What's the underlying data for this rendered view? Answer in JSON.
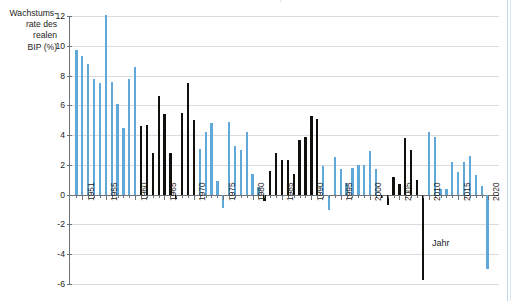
{
  "title_faint": "Wachstumsrate des realen Bruttoinlandsprodukts in Deutschland 1950–2020",
  "y_axis": {
    "label_lines": [
      "Wachstums-",
      "rate des",
      "realen",
      "BIP (%)"
    ],
    "ticks": [
      12,
      10,
      8,
      6,
      4,
      2,
      0,
      -2,
      -4,
      -6
    ],
    "tick_labels": [
      "12",
      "10",
      "8",
      "6",
      "4",
      "2",
      "0",
      "-2",
      "-4",
      "-6"
    ],
    "min": -6,
    "max": 12
  },
  "x_axis": {
    "title": "Jahr",
    "tick_labels": [
      "1951",
      "1955",
      "1960",
      "1965",
      "1970",
      "1975",
      "1980",
      "1985",
      "1990",
      "1995",
      "2000",
      "2005",
      "2010",
      "2015",
      "2020"
    ],
    "min": 1950,
    "max": 2020
  },
  "colors": {
    "blue": "#5fa8d8",
    "black": "#12100c",
    "grid": "#d9dde1",
    "axis": "#6e7378",
    "text": "#1d1d1b",
    "page_rule": "#bcd9ee"
  },
  "chart_data": {
    "type": "bar",
    "title": "Wachstumsrate des realen Bruttoinlandsprodukts in Deutschland 1950–2020",
    "xlabel": "Jahr",
    "ylabel": "Wachstumsrate des realen BIP (%)",
    "ylim": [
      -6,
      12
    ],
    "xlim": [
      1950,
      2020
    ],
    "grid": true,
    "legend": "none",
    "categories": [
      1950,
      1951,
      1952,
      1953,
      1954,
      1955,
      1956,
      1957,
      1958,
      1959,
      1960,
      1961,
      1962,
      1963,
      1964,
      1965,
      1966,
      1967,
      1968,
      1969,
      1970,
      1971,
      1972,
      1973,
      1974,
      1975,
      1976,
      1977,
      1978,
      1979,
      1980,
      1981,
      1982,
      1983,
      1984,
      1985,
      1986,
      1987,
      1988,
      1989,
      1990,
      1991,
      1992,
      1993,
      1994,
      1995,
      1996,
      1997,
      1998,
      1999,
      2000,
      2001,
      2002,
      2003,
      2004,
      2005,
      2006,
      2007,
      2008,
      2009,
      2010,
      2011,
      2012,
      2013,
      2014,
      2015,
      2016,
      2017,
      2018,
      2019,
      2020
    ],
    "values": [
      9.7,
      9.3,
      8.8,
      7.8,
      7.5,
      12.1,
      7.6,
      6.1,
      4.5,
      7.8,
      8.6,
      4.6,
      4.7,
      2.8,
      6.6,
      5.4,
      2.8,
      -0.3,
      5.5,
      7.5,
      5.0,
      3.1,
      4.2,
      4.8,
      0.9,
      -0.9,
      4.9,
      3.3,
      3.0,
      4.2,
      1.4,
      0.5,
      -0.4,
      1.6,
      2.8,
      2.3,
      2.3,
      1.4,
      3.7,
      3.9,
      5.3,
      5.1,
      1.9,
      -1.0,
      2.5,
      1.7,
      0.8,
      1.8,
      2.0,
      2.0,
      2.9,
      1.7,
      -0.2,
      -0.7,
      1.2,
      0.7,
      3.8,
      3.0,
      1.0,
      -5.7,
      4.2,
      3.9,
      0.4,
      0.4,
      2.2,
      1.5,
      2.2,
      2.6,
      1.3,
      0.6,
      -5.0
    ],
    "series_colors": [
      "blue",
      "blue",
      "blue",
      "blue",
      "blue",
      "blue",
      "blue",
      "blue",
      "blue",
      "blue",
      "blue",
      "black",
      "black",
      "black",
      "black",
      "black",
      "black",
      "black",
      "black",
      "black",
      "black",
      "blue",
      "blue",
      "blue",
      "blue",
      "blue",
      "blue",
      "blue",
      "blue",
      "blue",
      "blue",
      "blue",
      "black",
      "black",
      "black",
      "black",
      "black",
      "black",
      "black",
      "black",
      "black",
      "black",
      "blue",
      "blue",
      "blue",
      "blue",
      "blue",
      "blue",
      "blue",
      "blue",
      "blue",
      "blue",
      "black",
      "black",
      "black",
      "black",
      "black",
      "black",
      "black",
      "black",
      "blue",
      "blue",
      "blue",
      "blue",
      "blue",
      "blue",
      "blue",
      "blue",
      "blue",
      "blue",
      "blue"
    ]
  }
}
